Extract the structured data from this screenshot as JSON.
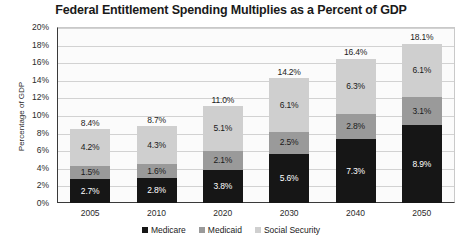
{
  "chart_data": {
    "type": "bar",
    "subtype": "stacked-column",
    "title": "Federal Entitlement Spending Multiplies as a Percent of GDP",
    "xlabel": "",
    "ylabel": "Percentage of GDP",
    "categories": [
      "2005",
      "2010",
      "2020",
      "2030",
      "2040",
      "2050"
    ],
    "ylim": [
      0,
      20
    ],
    "ytick_step": 2,
    "ytick_labels": [
      "0%",
      "2%",
      "4%",
      "6%",
      "8%",
      "10%",
      "12%",
      "14%",
      "16%",
      "18%",
      "20%"
    ],
    "grid": true,
    "legend_position": "bottom",
    "value_suffix": "%",
    "series": [
      {
        "name": "Medicare",
        "color": "#161616",
        "values": [
          2.7,
          2.8,
          3.8,
          5.6,
          7.3,
          8.9
        ],
        "labels": [
          "2.7%",
          "2.8%",
          "3.8%",
          "5.6%",
          "7.3%",
          "8.9%"
        ]
      },
      {
        "name": "Medicaid",
        "color": "#9a9a9a",
        "values": [
          1.5,
          1.6,
          2.1,
          2.5,
          2.8,
          3.1
        ],
        "labels": [
          "1.5%",
          "1.6%",
          "2.1%",
          "2.5%",
          "2.8%",
          "3.1%"
        ]
      },
      {
        "name": "Social Security",
        "color": "#cfcfcf",
        "values": [
          4.2,
          4.3,
          5.1,
          6.1,
          6.3,
          6.1
        ],
        "labels": [
          "4.2%",
          "4.3%",
          "5.1%",
          "6.1%",
          "6.3%",
          "6.1%"
        ]
      }
    ],
    "totals": [
      8.4,
      8.7,
      11.0,
      14.2,
      16.4,
      18.1
    ],
    "total_labels": [
      "8.4%",
      "8.7%",
      "11.0%",
      "14.2%",
      "16.4%",
      "18.1%"
    ]
  },
  "legend": {
    "items": [
      {
        "label": "Medicare",
        "color": "#161616"
      },
      {
        "label": "Medicaid",
        "color": "#9a9a9a"
      },
      {
        "label": "Social Security",
        "color": "#cfcfcf"
      }
    ]
  }
}
